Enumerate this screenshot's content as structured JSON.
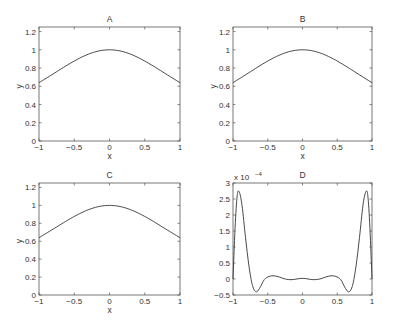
{
  "chart_data": [
    {
      "type": "line",
      "title": "A",
      "xlabel": "x",
      "ylabel": "y",
      "xlim": [
        -1,
        1
      ],
      "ylim": [
        0,
        1.25
      ],
      "xticks": [
        -1,
        -0.5,
        0,
        0.5,
        1
      ],
      "xtick_labels": [
        "-1",
        "-0.5",
        "0",
        "0.5",
        "1"
      ],
      "yticks": [
        0,
        0.2,
        0.4,
        0.6,
        0.8,
        1,
        1.2
      ],
      "ytick_labels": [
        "0",
        "0.2",
        "0.4",
        "0.6",
        "0.8",
        "1",
        "1.2"
      ],
      "grid": false,
      "series": [
        {
          "name": "A",
          "x": [
            -1,
            -0.75,
            -0.5,
            -0.25,
            0,
            0.25,
            0.5,
            0.75,
            1
          ],
          "values": [
            0.64,
            0.75,
            0.87,
            0.97,
            1.0,
            0.97,
            0.87,
            0.75,
            0.64
          ]
        }
      ]
    },
    {
      "type": "line",
      "title": "B",
      "xlabel": "x",
      "ylabel": "y",
      "xlim": [
        -1,
        1
      ],
      "ylim": [
        0,
        1.25
      ],
      "xticks": [
        -1,
        -0.5,
        0,
        0.5,
        1
      ],
      "xtick_labels": [
        "-1",
        "-0.5",
        "0",
        "0.5",
        "1"
      ],
      "yticks": [
        0,
        0.2,
        0.4,
        0.6,
        0.8,
        1,
        1.2
      ],
      "ytick_labels": [
        "0",
        "0.2",
        "0.4",
        "0.6",
        "0.8",
        "1",
        "1.2"
      ],
      "grid": false,
      "series": [
        {
          "name": "B",
          "x": [
            -1,
            -0.75,
            -0.5,
            -0.25,
            0,
            0.25,
            0.5,
            0.75,
            1
          ],
          "values": [
            0.64,
            0.75,
            0.87,
            0.97,
            1.0,
            0.97,
            0.87,
            0.75,
            0.64
          ]
        }
      ]
    },
    {
      "type": "line",
      "title": "C",
      "xlabel": "x",
      "ylabel": "y",
      "xlim": [
        -1,
        1
      ],
      "ylim": [
        0,
        1.25
      ],
      "xticks": [
        -1,
        -0.5,
        0,
        0.5,
        1
      ],
      "xtick_labels": [
        "-1",
        "-0.5",
        "0",
        "0.5",
        "1"
      ],
      "yticks": [
        0,
        0.2,
        0.4,
        0.6,
        0.8,
        1,
        1.2
      ],
      "ytick_labels": [
        "0",
        "0.2",
        "0.4",
        "0.6",
        "0.8",
        "1",
        "1.2"
      ],
      "grid": false,
      "series": [
        {
          "name": "C",
          "x": [
            -1,
            -0.75,
            -0.5,
            -0.25,
            0,
            0.25,
            0.5,
            0.75,
            1
          ],
          "values": [
            0.64,
            0.75,
            0.87,
            0.97,
            1.0,
            0.97,
            0.87,
            0.75,
            0.64
          ]
        }
      ]
    },
    {
      "type": "line",
      "title": "D",
      "xlabel": "",
      "ylabel": "",
      "scale_note": "x 10^-4",
      "xlim": [
        -1,
        1
      ],
      "ylim": [
        -0.5,
        3
      ],
      "xticks": [
        -1,
        -0.5,
        0,
        0.5,
        1
      ],
      "xtick_labels": [
        "-1",
        "-0.5",
        "0",
        "0.5",
        "1"
      ],
      "yticks": [
        -0.5,
        0,
        0.5,
        1,
        1.5,
        2,
        2.5,
        3
      ],
      "ytick_labels": [
        "-0.5",
        "0",
        "0.5",
        "1",
        "1.5",
        "2",
        "2.5",
        "3"
      ],
      "grid": false,
      "series": [
        {
          "name": "D (×10^-4)",
          "x": [
            -1,
            -0.97,
            -0.94,
            -0.91,
            -0.87,
            -0.82,
            -0.77,
            -0.72,
            -0.67,
            -0.62,
            -0.55,
            -0.48,
            -0.41,
            -0.33,
            -0.25,
            -0.15,
            0,
            0.15,
            0.25,
            0.33,
            0.41,
            0.48,
            0.55,
            0.62,
            0.67,
            0.72,
            0.77,
            0.82,
            0.87,
            0.91,
            0.94,
            0.97,
            1
          ],
          "values": [
            0,
            1.6,
            2.6,
            2.72,
            2.3,
            1.3,
            0.4,
            -0.2,
            -0.4,
            -0.3,
            -0.02,
            0.08,
            0.1,
            0.06,
            0.0,
            -0.02,
            0.02,
            -0.02,
            0.0,
            0.06,
            0.1,
            0.08,
            -0.02,
            -0.3,
            -0.4,
            -0.2,
            0.4,
            1.3,
            2.3,
            2.72,
            2.6,
            1.6,
            0
          ]
        }
      ]
    }
  ],
  "panels": {
    "A": {
      "title": "A",
      "xlabel": "x",
      "ylabel": "y"
    },
    "B": {
      "title": "B",
      "xlabel": "x",
      "ylabel": "y"
    },
    "C": {
      "title": "C",
      "xlabel": "x",
      "ylabel": "y"
    },
    "D": {
      "title": "D",
      "scale_label": "x 10",
      "scale_exp": "-4"
    }
  }
}
